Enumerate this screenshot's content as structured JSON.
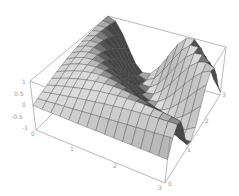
{
  "chart_data": {
    "type": "surface3d",
    "title": "",
    "function_approximation": "z = sin(y * (x + 0.5))",
    "x_range": [
      0,
      3
    ],
    "y_range": [
      0,
      3
    ],
    "z_range": [
      -1,
      1
    ],
    "grid_cells": 15,
    "x_ticks": [
      "1",
      "2",
      "3"
    ],
    "y_ticks": [
      "0",
      "1",
      "2",
      "3"
    ],
    "z_ticks": [
      "1",
      "0.5",
      "0",
      "-0.5",
      "-1"
    ],
    "origin_tick": "0",
    "xlabel": "",
    "ylabel": "",
    "zlabel": "",
    "boxed": true,
    "shading": "grayscale lit surface with dark mesh lines"
  },
  "projection": {
    "base": {
      "x0y0": [
        36,
        130
      ],
      "x3y0": [
        165,
        183
      ],
      "x3y3": [
        220,
        95
      ],
      "x0y3": [
        104,
        62
      ]
    },
    "top": {
      "x0y0": [
        30,
        81
      ],
      "x3y0": [
        170,
        136
      ],
      "x3y3": [
        226,
        47
      ],
      "x0y3": [
        108,
        16
      ]
    }
  },
  "colors": {
    "background": "#ffffff",
    "box": "#8a8a8a",
    "mesh": "#3c3c3c",
    "tick_text": "#9a9a9a"
  }
}
